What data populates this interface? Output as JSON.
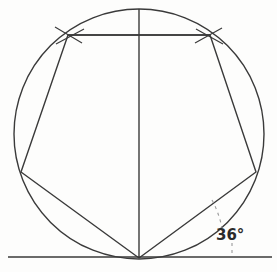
{
  "figure": {
    "kind": "geometric-construction",
    "background_color": "#fdfdfc",
    "ink_color": "#3a3a3a",
    "label_color": "#2b2b2b"
  },
  "annotations": {
    "angle_label": "36°",
    "angle_value": 36,
    "angle_unit": "degrees"
  },
  "geometry": {
    "circle": {
      "cx": 139,
      "cy": 134,
      "r": 125,
      "stroke_width": 1.4
    },
    "pentagon": {
      "points": "139,258 21,172 68,35 210,35 256,172",
      "stroke_width": 1.4
    },
    "vertices": {
      "bottom": {
        "x": 139,
        "y": 258
      },
      "left": {
        "x": 21,
        "y": 172
      },
      "upper_left": {
        "x": 68,
        "y": 35
      },
      "upper_right": {
        "x": 210,
        "y": 35
      },
      "right": {
        "x": 256,
        "y": 172
      }
    },
    "center_vertical_line": {
      "x1": 139,
      "y1": 9,
      "x2": 139,
      "y2": 258
    },
    "top_chord_line": {
      "x1": 68,
      "y1": 35,
      "x2": 210,
      "y2": 35
    },
    "baseline": {
      "x1": 8,
      "y1": 257,
      "x2": 272,
      "y2": 257
    },
    "angle_arc": {
      "d": "M 212 200 Q 219 213 222 228",
      "dash": "3 4"
    },
    "angle_tick": {
      "x1": 232,
      "y1": 243,
      "x2": 232,
      "y2": 257,
      "dash": "3 4"
    },
    "compass_ticks": [
      {
        "x1": 55,
        "y1": 27,
        "x2": 82,
        "y2": 43
      },
      {
        "x1": 56,
        "y1": 44,
        "x2": 84,
        "y2": 29
      },
      {
        "x1": 196,
        "y1": 29,
        "x2": 223,
        "y2": 44
      },
      {
        "x1": 195,
        "y1": 43,
        "x2": 222,
        "y2": 28
      }
    ]
  },
  "label_positions": {
    "angle_label": {
      "left": 216,
      "top": 228
    }
  }
}
